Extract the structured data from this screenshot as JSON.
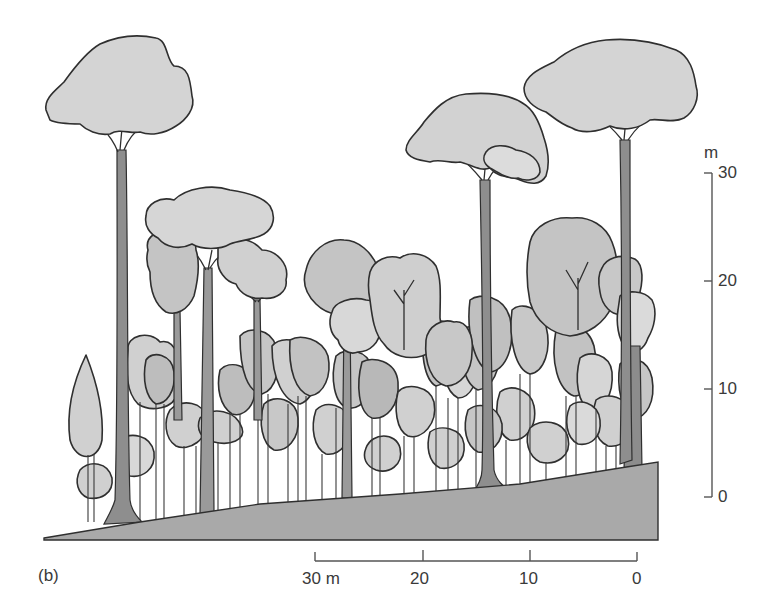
{
  "figure": {
    "panel_label": "(b)"
  },
  "vertical_scale": {
    "unit": "m",
    "ticks": [
      "30",
      "20",
      "10",
      "0"
    ]
  },
  "horizontal_scale": {
    "ticks": [
      "30 m",
      "20",
      "10",
      "0"
    ]
  },
  "colors": {
    "crown_light": "#d2d2d2",
    "crown_mid": "#c4c4c4",
    "crown_dark": "#b6b6b6",
    "trunk": "#9a9a9a",
    "ground": "#a9a9a9",
    "outline": "#2f2f2f",
    "scale": "#555555"
  },
  "layers": [
    {
      "name": "emergent",
      "trees": 3
    },
    {
      "name": "canopy",
      "trees": 6
    },
    {
      "name": "understory",
      "trees": "many"
    }
  ]
}
